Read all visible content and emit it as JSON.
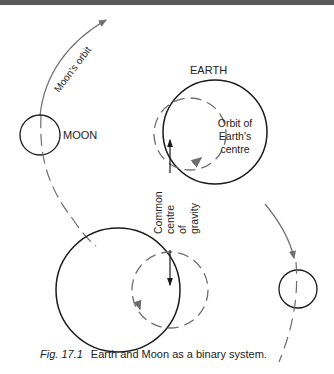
{
  "figure": {
    "labels": {
      "moon_orbit": "Moon's orbit",
      "earth": "EARTH",
      "moon": "MOON",
      "orbit_line1": "Orbit of",
      "orbit_line2": "Earth's",
      "orbit_line3": "centre",
      "cog_line1": "Common",
      "cog_line2": "centre",
      "cog_line3": "of",
      "cog_line4": "gravity"
    },
    "caption": {
      "fig_number": "Fig. 17.1",
      "text": "Earth and Moon as a binary system."
    },
    "colors": {
      "solid": "#1a1a1a",
      "dashed": "#6e6e6e",
      "topbar": "#5a5a5a"
    }
  }
}
